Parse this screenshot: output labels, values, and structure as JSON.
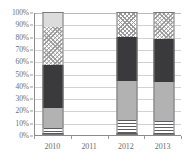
{
  "chart_data": {
    "type": "bar",
    "subtype": "stacked-percentage-column",
    "title": "",
    "xlabel": "",
    "ylabel": "",
    "categories": [
      "2010",
      "2011",
      "2012",
      "2013"
    ],
    "ylim": [
      0,
      100
    ],
    "y_unit": "%",
    "y_tick_labels": [
      "0%",
      "10%",
      "20%",
      "30%",
      "40%",
      "50%",
      "60%",
      "70%",
      "80%",
      "90%",
      "100%"
    ],
    "y_tick_values": [
      0,
      10,
      20,
      30,
      40,
      50,
      60,
      70,
      80,
      90,
      100
    ],
    "grid": true,
    "grid_orientation": "horizontal",
    "legend": false,
    "legend_position": "none",
    "series": [
      {
        "name": "Series 1",
        "pattern": "solid-dark-gray",
        "color": "#58585a",
        "values": [
          2,
          null,
          2,
          2
        ]
      },
      {
        "name": "Series 2",
        "pattern": "horizontal-stripes",
        "color": "#5d5d5f",
        "values": [
          4,
          null,
          10,
          9
        ]
      },
      {
        "name": "Series 3",
        "pattern": "solid-medium-gray",
        "color": "#b2b2b2",
        "values": [
          16,
          null,
          32,
          32
        ]
      },
      {
        "name": "Series 4",
        "pattern": "solid-charcoal",
        "color": "#3a3a3c",
        "values": [
          35,
          null,
          36,
          35
        ]
      },
      {
        "name": "Series 5",
        "pattern": "crosshatch",
        "color": "#9b9b9b",
        "values": [
          31,
          null,
          20,
          22
        ]
      },
      {
        "name": "Series 6",
        "pattern": "solid-light-gray",
        "color": "#dcdcdc",
        "values": [
          12,
          null,
          0,
          0
        ]
      }
    ],
    "cumulative_tops": {
      "2010": [
        2,
        6,
        22,
        57,
        88,
        100
      ],
      "2011": [],
      "2012": [
        2,
        12,
        44,
        80,
        100,
        100
      ],
      "2013": [
        2,
        11,
        43,
        78,
        100,
        100
      ]
    },
    "empty_categories": [
      "2011"
    ]
  },
  "axis": {
    "y_labels": [
      "100%",
      "90%",
      "80%",
      "70%",
      "60%",
      "50%",
      "40%",
      "30%",
      "20%",
      "10%",
      "0%"
    ],
    "x_labels": [
      "2010",
      "2011",
      "2012",
      "2013"
    ]
  },
  "colors": {
    "axis_line": "#8a8a8a",
    "gridline": "#d2d2d2",
    "tick_text": "#6e6e6e",
    "segment_border": "#7a7a7a",
    "background": "#ffffff"
  }
}
